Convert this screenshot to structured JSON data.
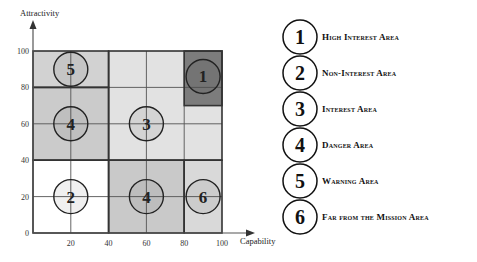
{
  "axes": {
    "y_title": "Attractivity",
    "x_title": "Capability",
    "y_ticks": [
      "0",
      "20",
      "40",
      "60",
      "80",
      "100"
    ],
    "x_ticks": [
      "20",
      "40",
      "60",
      "80",
      "100"
    ]
  },
  "regions": [
    {
      "id": "warning",
      "number": "5",
      "x0": 0,
      "x1": 40,
      "y0": 80,
      "y1": 100,
      "fill": "#d2d2d2",
      "cx": 20,
      "cy": 90
    },
    {
      "id": "danger-top",
      "number": "4",
      "x0": 0,
      "x1": 40,
      "y0": 40,
      "y1": 80,
      "fill": "#cbcbcb",
      "cx": 20,
      "cy": 60
    },
    {
      "id": "interest",
      "number": "3",
      "x0": 40,
      "x1": 100,
      "y0": 40,
      "y1": 100,
      "fill": "#e2e2e2",
      "cx": 60,
      "cy": 60
    },
    {
      "id": "high-interest",
      "number": "1",
      "x0": 80,
      "x1": 100,
      "y0": 70,
      "y1": 100,
      "fill": "#7c7c7c",
      "cx": 90,
      "cy": 86
    },
    {
      "id": "non-interest",
      "number": "2",
      "x0": 0,
      "x1": 40,
      "y0": 0,
      "y1": 40,
      "fill": "#ffffff",
      "cx": 20,
      "cy": 20
    },
    {
      "id": "danger-bottom",
      "number": "4",
      "x0": 40,
      "x1": 80,
      "y0": 0,
      "y1": 40,
      "fill": "#c9c9c9",
      "cx": 60,
      "cy": 20
    },
    {
      "id": "far-from-mission",
      "number": "6",
      "x0": 80,
      "x1": 100,
      "y0": 0,
      "y1": 40,
      "fill": "#d9d9d9",
      "cx": 90,
      "cy": 20
    }
  ],
  "legend": [
    {
      "number": "1",
      "label": "High Interest Area"
    },
    {
      "number": "2",
      "label": "Non-Interest Area"
    },
    {
      "number": "3",
      "label": "Interest Area"
    },
    {
      "number": "4",
      "label": "Danger Area"
    },
    {
      "number": "5",
      "label": "Warning Area"
    },
    {
      "number": "6",
      "label": "Far from the Mission Area"
    }
  ]
}
